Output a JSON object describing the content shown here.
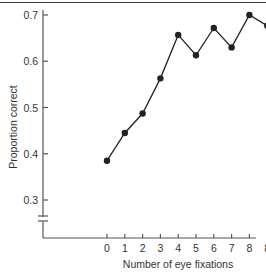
{
  "chart_data": {
    "type": "line",
    "title": "",
    "xlabel": "Number of eye fixations",
    "ylabel": "Proportion correct",
    "categories": [
      "0",
      "1",
      "2",
      "3",
      "4",
      "5",
      "6",
      "7",
      "8",
      "8+"
    ],
    "series": [
      {
        "name": "Proportion correct",
        "values": [
          0.385,
          0.445,
          0.487,
          0.563,
          0.657,
          0.613,
          0.672,
          0.63,
          0.7,
          0.677
        ]
      }
    ],
    "yticks": [
      "0.3",
      "0.4",
      "0.5",
      "0.6",
      "0.7"
    ],
    "ylim": [
      0.3,
      0.7
    ],
    "y_axis_break": true,
    "grid": false,
    "legend": "none",
    "line_color": "#222222",
    "marker": "filled-circle"
  }
}
